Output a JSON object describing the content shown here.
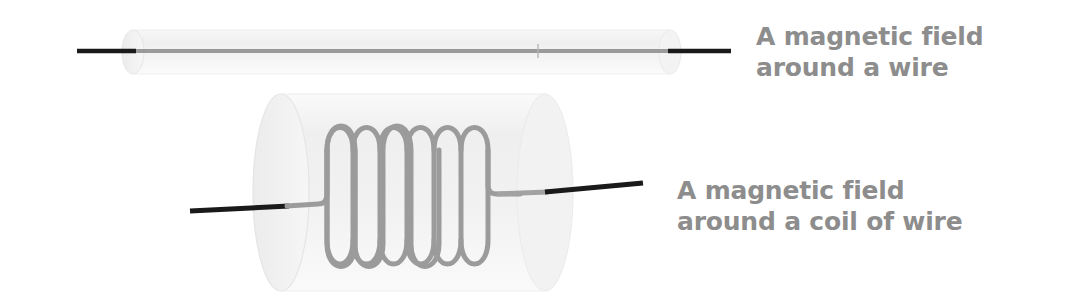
{
  "canvas": {
    "width": 1073,
    "height": 304,
    "background": "#ffffff"
  },
  "palette": {
    "text_gray": "#8d8d8d",
    "wire_black": "#1a1a1a",
    "wire_gray": "#9a9a9a",
    "coil_gray": "#9b9b9b",
    "cylinder_fill": "#f1f1f1",
    "cylinder_edge": "#e4e4e4",
    "cylinder_cap": "#ededed"
  },
  "figures": [
    {
      "id": "straight-wire",
      "name": "magnetic-field-around-wire",
      "caption": "A magnetic field\naround a wire",
      "field_cylinder": {
        "x": 133,
        "y": 30,
        "width": 537,
        "height": 44,
        "cap_rx": 11
      },
      "wire": {
        "y": 51,
        "x_start": 77,
        "x_end": 731,
        "thickness": 4,
        "inside_color": "#9a9a9a",
        "outside_color": "#1a1a1a"
      }
    },
    {
      "id": "coil-wire",
      "name": "magnetic-field-around-coil",
      "caption": "A magnetic field\naround a coil of wire",
      "field_cylinder": {
        "x": 253,
        "y": 94,
        "width": 292,
        "height": 197,
        "cap_rx": 28
      },
      "coil": {
        "turns": 6,
        "x_start": 327,
        "x_end": 491,
        "top_y": 118,
        "bottom_y": 272,
        "stroke_width": 5,
        "color": "#9b9b9b"
      },
      "lead_left": {
        "x_start": 190,
        "y_start": 210,
        "x_black_end": 287,
        "x_bend": 327,
        "y_bend": 205,
        "thickness": 5
      },
      "lead_right": {
        "x_bend": 491,
        "y_bend": 194,
        "x_gray_end": 546,
        "x_end": 643,
        "y_end": 183,
        "thickness": 5
      }
    }
  ]
}
